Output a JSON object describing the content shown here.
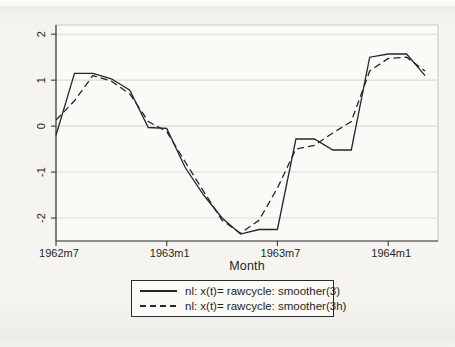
{
  "window": {
    "type": "stata-line-graph"
  },
  "axis": {
    "x_title": "Month",
    "y_tick_labels": [
      "2",
      "1",
      "0",
      "-1",
      "-2"
    ],
    "x_tick_labels": [
      "1962m7",
      "1963m1",
      "1963m7",
      "1964m1"
    ]
  },
  "legend": {
    "entries": [
      {
        "label": "nl: x(t)= rawcycle: smoother(3)",
        "style": "solid"
      },
      {
        "label": "nl: x(t)= rawcycle: smoother(3h)",
        "style": "dashed"
      }
    ]
  },
  "colors": {
    "line": "#262626",
    "grid": "#dcdad5",
    "axis": "#3c3c3c",
    "box": "#c9c7c2",
    "text": "#1f1f1f",
    "plot_bg": "#fbfaf7",
    "page_bg": "#f4f3f0"
  },
  "chart_data": {
    "type": "line",
    "title": "",
    "xlabel": "Month",
    "ylabel": "",
    "grid": true,
    "legend_position": "bottom-center",
    "categories": [
      "1962m7",
      "1962m8",
      "1962m9",
      "1962m10",
      "1962m11",
      "1962m12",
      "1963m1",
      "1963m2",
      "1963m3",
      "1963m4",
      "1963m5",
      "1963m6",
      "1963m7",
      "1963m8",
      "1963m9",
      "1963m10",
      "1963m11",
      "1963m12",
      "1964m1",
      "1964m2",
      "1964m3"
    ],
    "series": [
      {
        "name": "nl: x(t)= rawcycle: smoother(3)",
        "style": "solid",
        "values": [
          -0.2,
          1.15,
          1.15,
          1.03,
          0.78,
          -0.03,
          -0.05,
          -0.9,
          -1.5,
          -2.0,
          -2.35,
          -2.25,
          -2.25,
          -0.28,
          -0.28,
          -0.52,
          -0.52,
          1.5,
          1.57,
          1.57,
          1.1
        ]
      },
      {
        "name": "nl: x(t)= rawcycle: smoother(3h)",
        "style": "dashed",
        "values": [
          0.13,
          0.55,
          1.1,
          0.98,
          0.7,
          0.1,
          -0.12,
          -0.78,
          -1.42,
          -2.05,
          -2.33,
          -2.05,
          -1.35,
          -0.5,
          -0.42,
          -0.15,
          0.1,
          1.2,
          1.47,
          1.5,
          1.2
        ]
      }
    ],
    "yticks": [
      -2,
      -1,
      0,
      1,
      2
    ],
    "ylim": [
      -2.5,
      2.2
    ],
    "xticks": [
      {
        "index": 0,
        "label": "1962m7"
      },
      {
        "index": 6,
        "label": "1963m1"
      },
      {
        "index": 12,
        "label": "1963m7"
      },
      {
        "index": 18,
        "label": "1964m1"
      }
    ],
    "xlim": [
      0,
      20.7
    ]
  }
}
